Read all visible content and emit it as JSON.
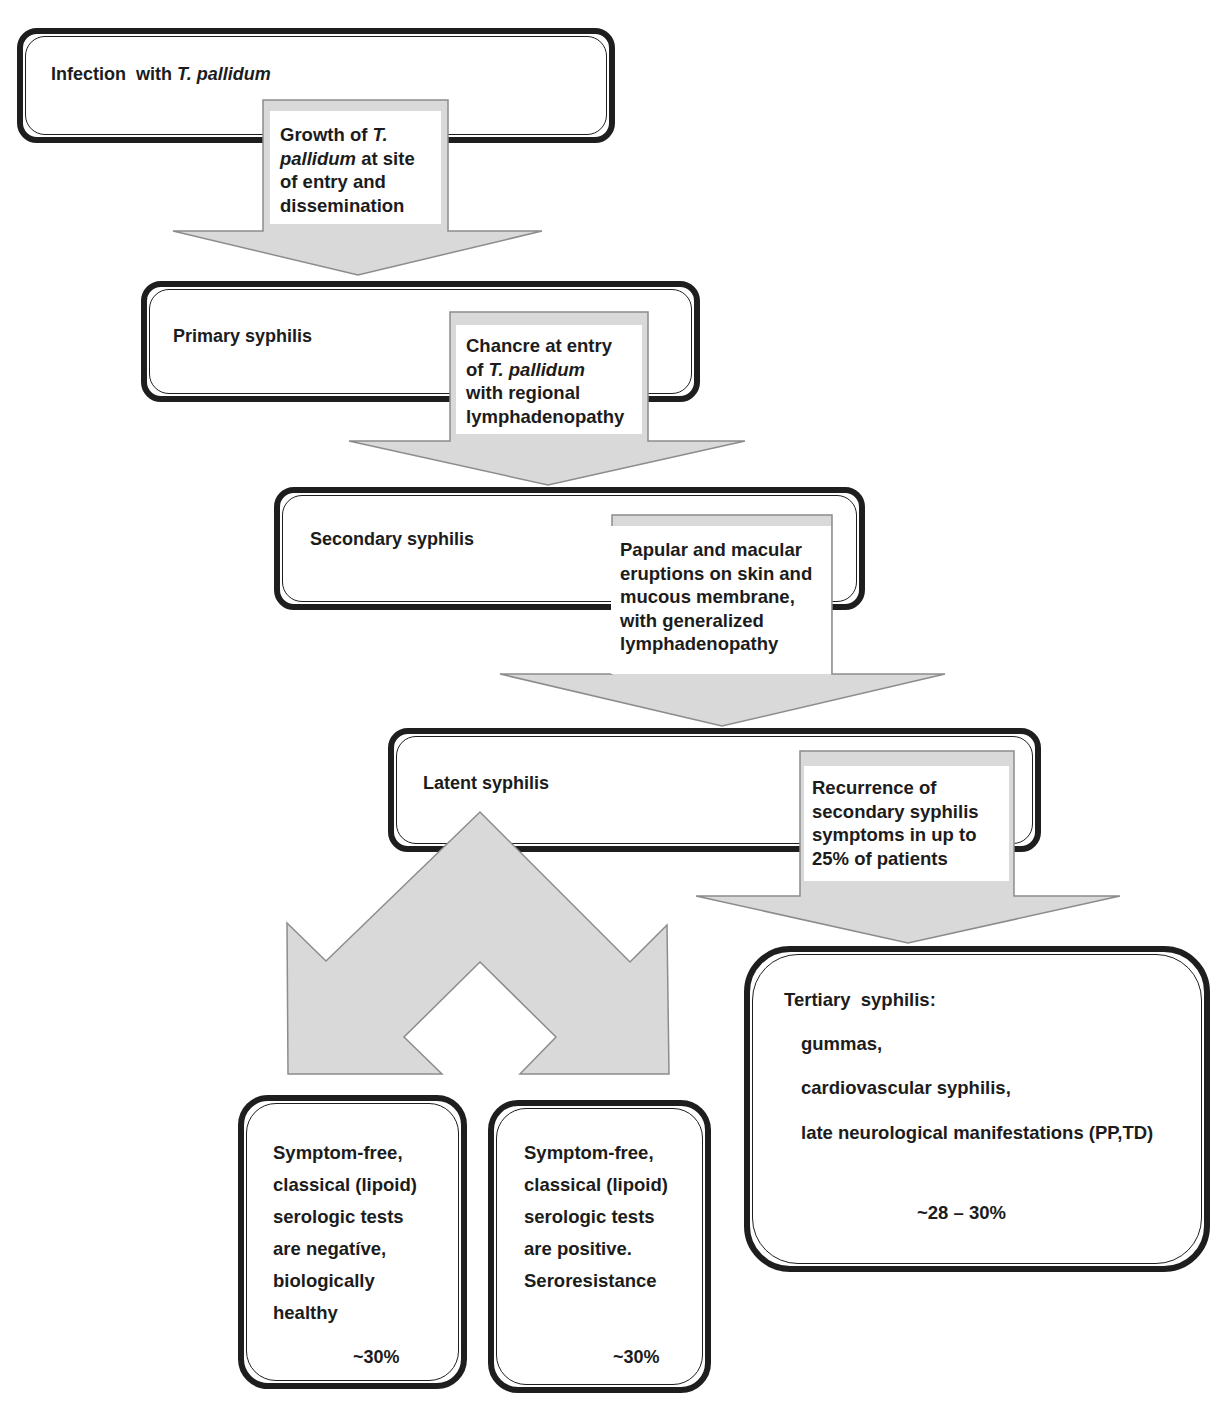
{
  "diagram": {
    "type": "flowchart",
    "colors": {
      "box_border": "#1e1e1e",
      "arrow_fill": "#d9d9d9",
      "arrow_stroke": "#8c8c8c",
      "text": "#1c1c1c"
    }
  },
  "stages": {
    "infection": {
      "label_prefix": "Infection  with ",
      "label_italic": "T. pallidum"
    },
    "primary": {
      "label": "Primary syphilis"
    },
    "secondary": {
      "label": "Secondary syphilis"
    },
    "latent": {
      "label": "Latent syphilis"
    },
    "tertiary": {
      "title": "Tertiary  syphilis:",
      "items": [
        "gummas,",
        "cardiovascular syphilis,",
        "late neurological manifestations (PP,TD)"
      ],
      "percentage": "~28 – 30%"
    }
  },
  "arrows": {
    "growth": {
      "l1a": "Growth of ",
      "l1i": "T.",
      "l2i": "pallidum",
      "l2b": " at site",
      "l3": "of entry and",
      "l4": "dissemination"
    },
    "chancre": {
      "l1": "Chancre at entry",
      "l2a": "of ",
      "l2i": "T. pallidum",
      "l3": "with regional",
      "l4": "lymphadenopathy"
    },
    "eruptions": {
      "lines": [
        "Papular and macular",
        "eruptions on skin and",
        "mucous membrane,",
        "with generalized",
        "lymphadenopathy"
      ]
    },
    "recurrence": {
      "lines": [
        "Recurrence of",
        "secondary syphilis",
        "symptoms in up to",
        "25% of patients"
      ]
    }
  },
  "outcomes": [
    {
      "lines": [
        "Symptom-free,",
        "classical (lipoid)",
        "serologic tests",
        "are negatíve,",
        "biologically",
        "healthy"
      ],
      "percentage": "~30%"
    },
    {
      "lines": [
        "Symptom-free,",
        "classical (lipoid)",
        "serologic tests",
        "are positive.",
        "Seroresistance"
      ],
      "percentage": "~30%"
    }
  ]
}
